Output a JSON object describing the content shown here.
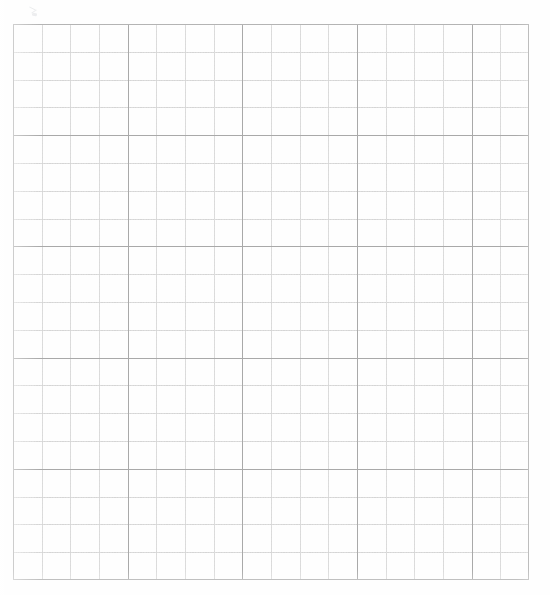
{
  "page": {
    "width": 550,
    "height": 595,
    "background_color": "#ffffff",
    "content_type": "blank-graph-paper-scan"
  },
  "grid": {
    "left": 13,
    "top": 24,
    "width": 516,
    "height": 556,
    "columns": 18,
    "rows": 20,
    "cell_width": 28.667,
    "cell_height": 27.8,
    "major_every": 4,
    "minor_color": "#dcdcdc",
    "major_color": "#a9a9a9",
    "border_color": "#b0b0b0",
    "paper_color": "#fefefe"
  },
  "annotations": {
    "margin_mark": {
      "label": "faint handwritten mark",
      "left": 27,
      "top": 6,
      "color": "#9aa0a6"
    }
  },
  "chart_data": {
    "type": "table",
    "title": "",
    "xlabel": "",
    "ylabel": "",
    "categories": [],
    "values": [],
    "grid": true,
    "legend": "none",
    "xlim": [
      0,
      18
    ],
    "ylim": [
      0,
      20
    ]
  }
}
